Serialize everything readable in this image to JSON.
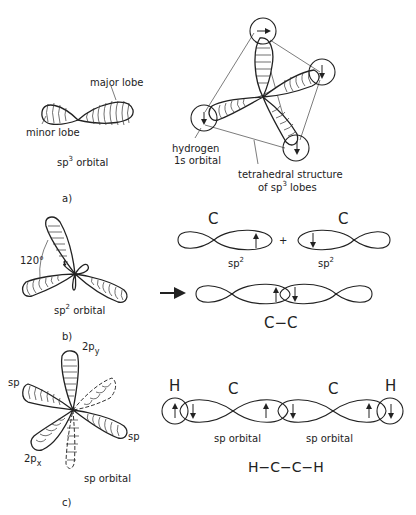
{
  "panel_a": {
    "caption": "a)",
    "sp3_label": "sp",
    "sp3_sup": "3",
    "sp3_suffix": " orbital",
    "major_lobe": "major lobe",
    "minor_lobe": "minor lobe",
    "hydrogen_line1": "hydrogen",
    "hydrogen_line2": "1s orbital",
    "tetra_line1": "tetrahedral structure",
    "tetra_line2_prefix": "of sp",
    "tetra_line2_sup": "3",
    "tetra_line2_suffix": "  lobes"
  },
  "panel_b": {
    "caption": "b)",
    "angle": "120°",
    "sp2_prefix": "sp",
    "sp2_sup": "2",
    "sp2_suffix": " orbital",
    "carbon_left": "C",
    "carbon_right": "C",
    "plus": "+",
    "sp2_left": "sp",
    "sp2_left_sup": "2",
    "sp2_right": "sp",
    "sp2_right_sup": "2",
    "bond_label": "C−C"
  },
  "panel_c": {
    "caption": "c)",
    "p_y": "2p",
    "p_y_sub": "y",
    "p_x": "2p",
    "p_x_sub": "x",
    "sp_left": "sp",
    "sp_right": "sp",
    "sp_orbital": "sp orbital",
    "h_left": "H",
    "c_left": "C",
    "c_right": "C",
    "h_right": "H",
    "sp_orbital_left": "sp orbital",
    "sp_orbital_right": "sp orbital",
    "molecule": "H−C−C−H"
  }
}
